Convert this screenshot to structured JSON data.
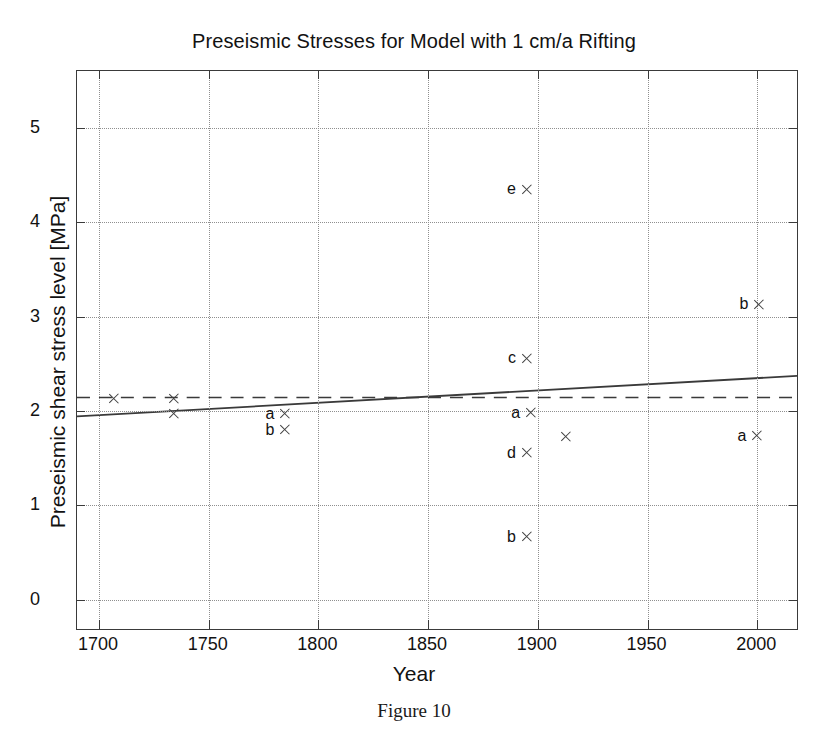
{
  "figure": {
    "caption": "Figure 10"
  },
  "chart_data": {
    "type": "scatter",
    "title": "Preseismic Stresses for Model with 1 cm/a Rifting",
    "xlabel": "Year",
    "ylabel": "Preseismic shear stress level [MPa]",
    "xlim": [
      1690,
      2019
    ],
    "ylim": [
      -0.33,
      5.6
    ],
    "xticks": [
      1700,
      1750,
      1800,
      1850,
      1900,
      1950,
      2000
    ],
    "xtick_labels": [
      "1700",
      "1750",
      "1800",
      "1850",
      "1900",
      "1950",
      "2000"
    ],
    "yticks": [
      0,
      1,
      2,
      3,
      4,
      5
    ],
    "ytick_labels": [
      "0",
      "1",
      "2",
      "3",
      "4",
      "5"
    ],
    "grid": "dotted",
    "legend": "none",
    "marker": "x",
    "points": [
      {
        "label": "",
        "x": 1707,
        "y": 2.13
      },
      {
        "label": "",
        "x": 1734,
        "y": 2.13
      },
      {
        "label": "",
        "x": 1734,
        "y": 1.97
      },
      {
        "label": "a",
        "x": 1785,
        "y": 1.97
      },
      {
        "label": "b",
        "x": 1785,
        "y": 1.8
      },
      {
        "label": "e",
        "x": 1895,
        "y": 4.35
      },
      {
        "label": "c",
        "x": 1895,
        "y": 2.56
      },
      {
        "label": "a",
        "x": 1897,
        "y": 1.98
      },
      {
        "label": "d",
        "x": 1895,
        "y": 1.56
      },
      {
        "label": "b",
        "x": 1895,
        "y": 0.67
      },
      {
        "label": "",
        "x": 1913,
        "y": 1.73
      },
      {
        "label": "b",
        "x": 2001,
        "y": 3.13
      },
      {
        "label": "a",
        "x": 2000,
        "y": 1.74
      }
    ],
    "series": [
      {
        "name": "trend-line",
        "style": "solid",
        "x": [
          1690,
          2019
        ],
        "y": [
          1.93,
          2.36
        ]
      },
      {
        "name": "threshold-line",
        "style": "dashed",
        "x": [
          1690,
          2019
        ],
        "y": [
          2.13,
          2.13
        ]
      }
    ]
  }
}
